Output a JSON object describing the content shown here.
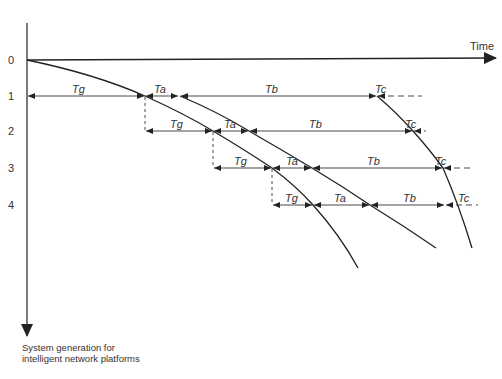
{
  "diagram": {
    "x_axis_label": "Time",
    "y_axis_label_line1": "System generation for",
    "y_axis_label_line2": "intelligent network platforms",
    "row_labels": [
      "0",
      "1",
      "2",
      "3",
      "4"
    ],
    "interval_labels": {
      "tg": "Tg",
      "ta": "Ta",
      "tb": "Tb",
      "tc": "Tc"
    },
    "rows": [
      {
        "row": "1",
        "intervals": [
          "Tg",
          "Ta",
          "Tb",
          "Tc"
        ]
      },
      {
        "row": "2",
        "intervals": [
          "Tg",
          "Ta",
          "Tb",
          "Tc"
        ]
      },
      {
        "row": "3",
        "intervals": [
          "Tg",
          "Ta",
          "Tb",
          "Tc"
        ]
      },
      {
        "row": "4",
        "intervals": [
          "Tg",
          "Ta",
          "Tb",
          "Tc"
        ]
      }
    ],
    "colors": {
      "line": "#222222",
      "text": "#333333"
    }
  }
}
